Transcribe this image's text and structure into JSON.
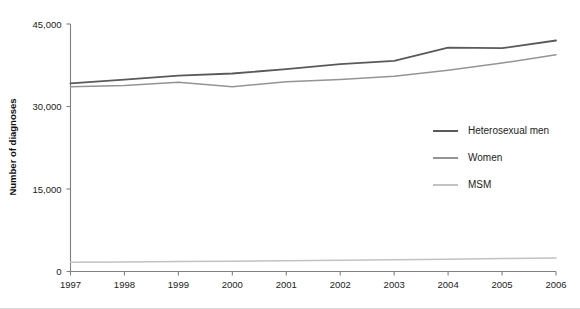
{
  "chart_data": {
    "type": "line",
    "title": "",
    "xlabel": "",
    "ylabel": "Number of diagnoses",
    "x": [
      1997,
      1998,
      1999,
      2000,
      2001,
      2002,
      2003,
      2004,
      2005,
      2006
    ],
    "categories": [
      "1997",
      "1998",
      "1999",
      "2000",
      "2001",
      "2002",
      "2003",
      "2004",
      "2005",
      "2006"
    ],
    "xlim": [
      1997,
      2006
    ],
    "ylim": [
      0,
      45000
    ],
    "yticks": [
      0,
      15000,
      30000,
      45000
    ],
    "ytick_labels": [
      "0",
      "15,000",
      "30,000",
      "45,000"
    ],
    "grid": false,
    "legend_position": "center-right",
    "series": [
      {
        "name": "Heterosexual men",
        "color": "#5a5a5a",
        "values": [
          34200,
          34900,
          35600,
          36000,
          36800,
          37700,
          38300,
          40700,
          40600,
          42000
        ]
      },
      {
        "name": "Women",
        "color": "#949494",
        "values": [
          33600,
          33800,
          34400,
          33600,
          34500,
          34900,
          35500,
          36600,
          37900,
          39400
        ]
      },
      {
        "name": "MSM",
        "color": "#c2c2c2",
        "values": [
          1700,
          1750,
          1800,
          1850,
          1950,
          2050,
          2150,
          2250,
          2350,
          2450
        ]
      }
    ]
  },
  "legend": {
    "items": [
      {
        "label": "Heterosexual men",
        "color": "#5a5a5a"
      },
      {
        "label": "Women",
        "color": "#949494"
      },
      {
        "label": "MSM",
        "color": "#c2c2c2"
      }
    ]
  },
  "axes": {
    "y_title": "Number of diagnoses",
    "y_tick_labels": [
      "45,000",
      "30,000",
      "15,000",
      "0"
    ],
    "x_tick_labels": [
      "1997",
      "1998",
      "1999",
      "2000",
      "2001",
      "2002",
      "2003",
      "2004",
      "2005",
      "2006"
    ]
  }
}
